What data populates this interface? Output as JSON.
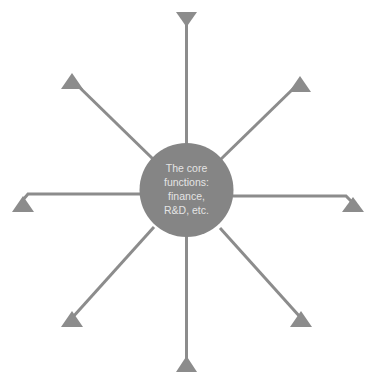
{
  "diagram": {
    "type": "hub-and-spoke",
    "hub": {
      "label_lines": [
        "The core",
        "functions:",
        "finance,",
        "R&D, etc."
      ],
      "color": "#858585",
      "text_color": "#e4e4e4"
    },
    "spokes": [
      {
        "position": "top",
        "arrow": "triangle-down"
      },
      {
        "position": "top-right",
        "arrow": "triangle-up"
      },
      {
        "position": "right",
        "arrow": "triangle-up"
      },
      {
        "position": "bottom-right",
        "arrow": "triangle-up"
      },
      {
        "position": "bottom",
        "arrow": "triangle-up"
      },
      {
        "position": "bottom-left",
        "arrow": "triangle-up"
      },
      {
        "position": "left",
        "arrow": "triangle-up"
      },
      {
        "position": "top-left",
        "arrow": "triangle-up"
      }
    ],
    "line_color": "#8c8c8c"
  }
}
